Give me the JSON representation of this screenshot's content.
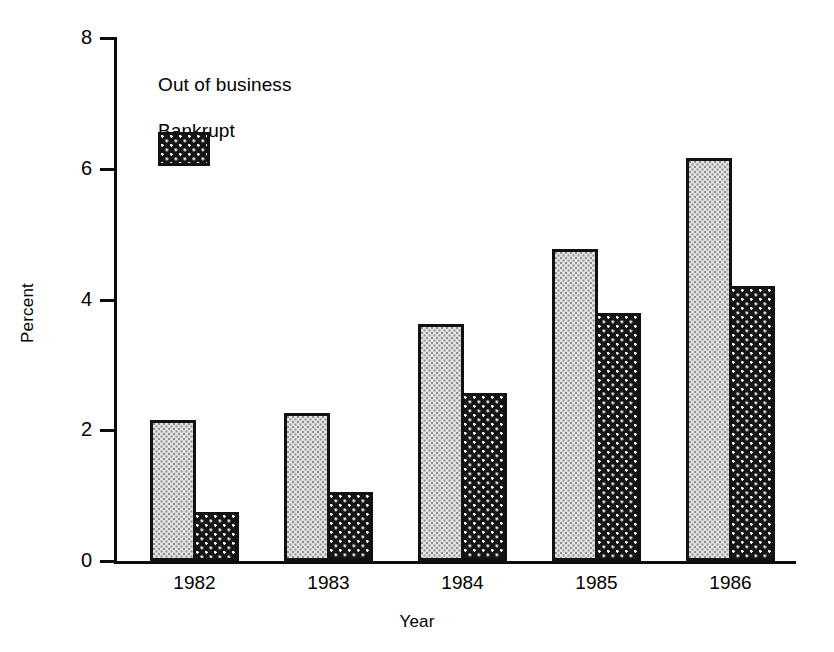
{
  "chart_data": {
    "type": "bar",
    "title": "",
    "xlabel": "Year",
    "ylabel": "Percent",
    "categories": [
      "1982",
      "1983",
      "1984",
      "1985",
      "1986"
    ],
    "series": [
      {
        "name": "Out of business",
        "values": [
          2.15,
          2.27,
          3.62,
          4.78,
          6.17
        ]
      },
      {
        "name": "Bankrupt",
        "values": [
          0.75,
          1.06,
          2.57,
          3.8,
          4.2
        ]
      }
    ],
    "ylim": [
      0,
      8
    ],
    "yticks": [
      "0",
      "2",
      "4",
      "6",
      "8"
    ],
    "ytick_values": [
      0,
      2,
      4,
      6,
      8
    ],
    "grid": false,
    "legend_position": "upper left",
    "colors": {
      "out_of_business": "#e3e3e3",
      "bankrupt": "#151515",
      "axis": "#0c0c0c",
      "background": "#ffffff"
    }
  },
  "legend": {
    "items": [
      {
        "label": "Out of business",
        "swatch": "light-dotted-swatch"
      },
      {
        "label": "Bankrupt",
        "swatch": "dark-checkered-swatch"
      }
    ]
  },
  "axes": {
    "y_title": "Percent",
    "x_title": "Year"
  }
}
